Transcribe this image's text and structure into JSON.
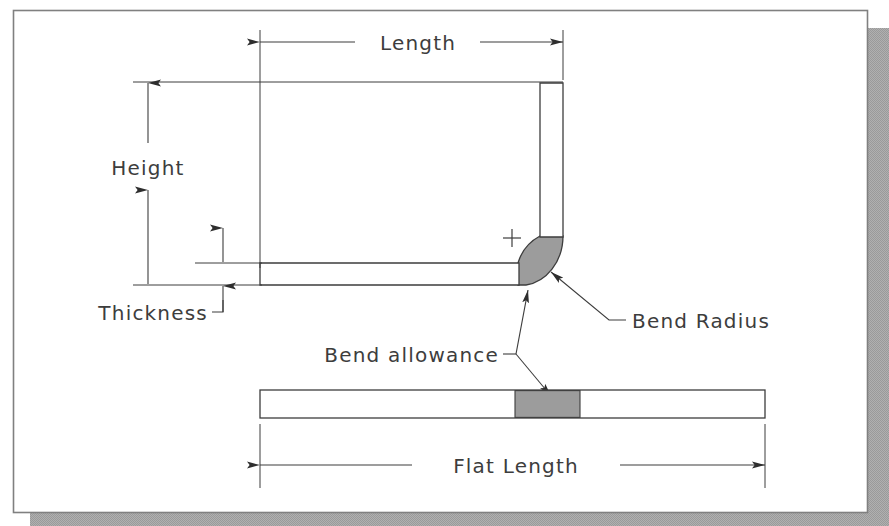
{
  "diagram": {
    "labels": {
      "length": "Length",
      "height": "Height",
      "thickness": "Thickness",
      "bend_radius": "Bend Radius",
      "bend_allowance": "Bend allowance",
      "flat_length": "Flat Length"
    },
    "colors": {
      "line": "#3d3d3d",
      "bend_fill": "#9c9c9c",
      "part_fill": "#ffffff",
      "paper": "#ffffff",
      "shadow": "#a8a8a8",
      "border": "#7a7a7a"
    },
    "parts": [
      {
        "name": "vertical-arm",
        "fill": "#ffffff"
      },
      {
        "name": "horizontal-arm",
        "fill": "#ffffff"
      },
      {
        "name": "bend-arc",
        "fill": "#9c9c9c"
      },
      {
        "name": "flat-strip",
        "fill": "#ffffff"
      },
      {
        "name": "flat-strip-bend-segment",
        "fill": "#9c9c9c"
      }
    ],
    "dimensions": [
      {
        "name": "length",
        "orientation": "horizontal",
        "label": "Length"
      },
      {
        "name": "height",
        "orientation": "vertical",
        "label": "Height"
      },
      {
        "name": "thickness",
        "orientation": "vertical",
        "label": "Thickness"
      },
      {
        "name": "flat-length",
        "orientation": "horizontal",
        "label": "Flat Length"
      }
    ],
    "leaders": [
      {
        "name": "bend-radius-leader",
        "label": "Bend Radius"
      },
      {
        "name": "bend-allowance-leader",
        "label": "Bend allowance"
      }
    ],
    "markers": [
      {
        "name": "bend-center-cross",
        "symbol": "+"
      }
    ]
  }
}
